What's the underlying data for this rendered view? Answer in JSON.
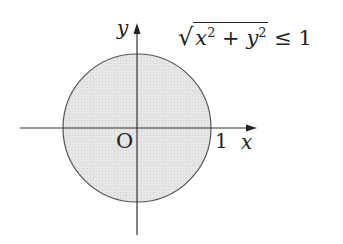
{
  "diagram": {
    "type": "unit-disk-region",
    "colors": {
      "fill": "#e4e4e4",
      "stroke": "#444444",
      "axis": "#333333",
      "text": "#222222"
    },
    "axes": {
      "x_label": "x",
      "y_label": "y",
      "origin_label": "O",
      "tick_label_x": "1"
    },
    "region": {
      "inequality_text": {
        "sqrt_open": "√",
        "x": "x",
        "x_exp": "2",
        "plus": " + ",
        "y": "y",
        "y_exp": "2",
        "rel": " ≤ ",
        "rhs": "1"
      },
      "shape": "circle",
      "center": [
        0,
        0
      ],
      "radius": 1
    }
  }
}
